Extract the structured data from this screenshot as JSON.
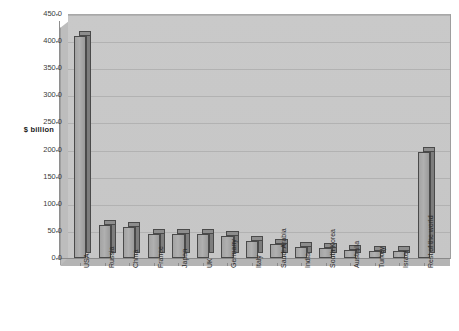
{
  "chart_data": {
    "type": "bar",
    "title": "",
    "subtitle": "",
    "xlabel": "",
    "ylabel": "$ billion",
    "ylim": [
      0,
      450
    ],
    "ytick_step": 50,
    "grid": true,
    "legend": "none",
    "style": "3d-column",
    "categories": [
      "USA",
      "Russia",
      "China",
      "France",
      "Japan",
      "UK",
      "Germany",
      "Italy",
      "Saudi Arabia",
      "India",
      "South Korea",
      "Australia",
      "Turkey",
      "Israel",
      "Rest of the world"
    ],
    "values": [
      410,
      60,
      58,
      45,
      45,
      45,
      40,
      32,
      25,
      20,
      18,
      15,
      13,
      12,
      195
    ],
    "ytick_labels": [
      "0.0",
      "50.0",
      "100.0",
      "150.0",
      "200.0",
      "250.0",
      "300.0",
      "350.0",
      "400.0",
      "450.0"
    ],
    "ytick_values": [
      0,
      50,
      100,
      150,
      200,
      250,
      300,
      350,
      400,
      450
    ],
    "series": [
      {
        "name": "Military expenditure",
        "values": [
          410,
          60,
          58,
          45,
          45,
          45,
          40,
          32,
          25,
          20,
          18,
          15,
          13,
          12,
          195
        ]
      }
    ],
    "colors": {
      "bar_face": "#a8a8a8",
      "bar_side": "#7d7d7d",
      "bar_top": "#8d8d8d",
      "bar_outline": "#4a4a4a",
      "plot_background": "#c7c7c7",
      "gridline": "#b2b2b2",
      "page_background": "#ffffff",
      "text": "#2b2b2b"
    }
  }
}
